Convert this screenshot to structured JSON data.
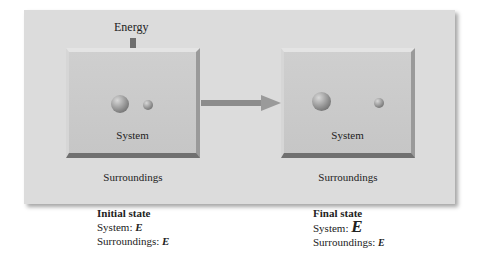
{
  "diagram": {
    "energy_label": "Energy",
    "initial": {
      "system_label": "System",
      "surroundings_label": "Surroundings",
      "caption_title": "Initial state",
      "system_text": "System: ",
      "system_E": "E",
      "surroundings_text": "Surroundings: ",
      "surroundings_E": "E"
    },
    "final": {
      "system_label": "System",
      "surroundings_label": "Surroundings",
      "caption_title": "Final state",
      "system_text": "System: ",
      "system_E": "E",
      "surroundings_text": "Surroundings: ",
      "surroundings_E": "E"
    },
    "colors": {
      "panel": "#dcdcdc",
      "box": "#c9c9c9",
      "arrow": "#8a8a8a"
    }
  }
}
